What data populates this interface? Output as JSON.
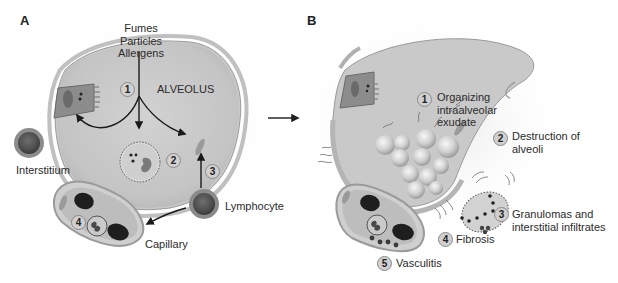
{
  "diagram": {
    "panels": [
      {
        "letter": "A",
        "trigger_lines": [
          "Fumes",
          "Particles",
          "Allergens"
        ],
        "region_label": "ALVEOLUS",
        "labels": {
          "interstitium": "Interstitium",
          "lymphocyte": "Lymphocyte",
          "capillary": "Capillary"
        },
        "steps": [
          "1",
          "2",
          "3",
          "4"
        ]
      },
      {
        "letter": "B",
        "annotations": [
          {
            "num": "1",
            "lines": [
              "Organizing",
              "intraalveolar",
              "exudate"
            ]
          },
          {
            "num": "2",
            "lines": [
              "Destruction of",
              "alveoli"
            ]
          },
          {
            "num": "3",
            "lines": [
              "Granulomas and",
              "interstitial infiltrates"
            ]
          },
          {
            "num": "4",
            "lines": [
              "Fibrosis"
            ]
          },
          {
            "num": "5",
            "lines": [
              "Vasculitis"
            ]
          }
        ]
      }
    ],
    "transition_arrow": "right-arrow",
    "colors": {
      "alveolus_fill": "#c9c9c9",
      "wall": "#b5b5b5",
      "dark_cell": "#3a3a3a",
      "step_badge": "#d0d0d0",
      "text": "#2b2b2b"
    }
  }
}
